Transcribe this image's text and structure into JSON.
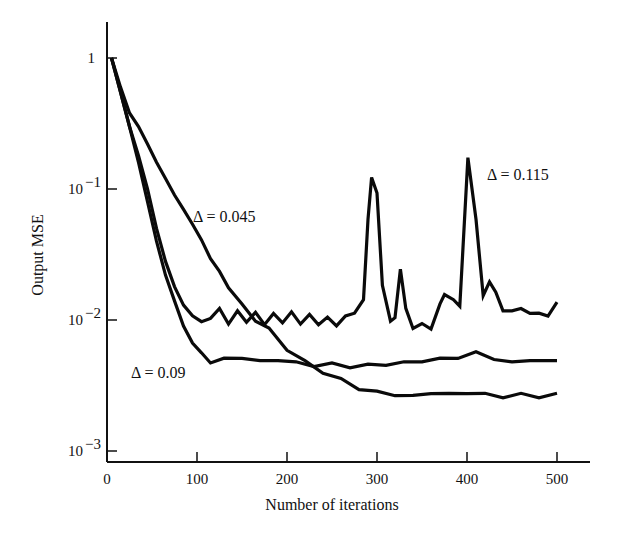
{
  "chart_data": {
    "type": "line",
    "title": "",
    "xlabel": "Number of iterations",
    "ylabel": "Output MSE",
    "xlim": [
      0,
      540
    ],
    "ylim": [
      0.001,
      1.5
    ],
    "yscale": "log",
    "grid": false,
    "legend": "none (inline annotations)",
    "x_ticks": [
      0,
      100,
      200,
      300,
      400,
      500
    ],
    "x_tick_labels": [
      "0",
      "100",
      "200",
      "300",
      "400",
      "500"
    ],
    "y_ticks": [
      1,
      0.1,
      0.01,
      0.001
    ],
    "y_tick_labels": [
      "1",
      "10^-1",
      "10^-2",
      "10^-3"
    ],
    "series": [
      {
        "name": "Δ = 0.045",
        "x": [
          5,
          15,
          25,
          35,
          45,
          55,
          65,
          75,
          85,
          95,
          105,
          115,
          125,
          135,
          150,
          165,
          180,
          200,
          220,
          240,
          260,
          280,
          300,
          320,
          340,
          360,
          380,
          400,
          420,
          440,
          460,
          480,
          500
        ],
        "y": [
          1.0,
          0.6,
          0.38,
          0.3,
          0.22,
          0.16,
          0.12,
          0.09,
          0.07,
          0.055,
          0.04,
          0.03,
          0.023,
          0.018,
          0.013,
          0.01,
          0.0085,
          0.006,
          0.0048,
          0.004,
          0.0035,
          0.003,
          0.0028,
          0.0027,
          0.0026,
          0.0028,
          0.0027,
          0.0028,
          0.0027,
          0.0026,
          0.0027,
          0.0026,
          0.0027
        ]
      },
      {
        "name": "Δ = 0.09",
        "x": [
          5,
          15,
          25,
          35,
          45,
          55,
          65,
          75,
          85,
          95,
          105,
          115,
          130,
          150,
          170,
          190,
          210,
          230,
          250,
          270,
          290,
          310,
          330,
          350,
          370,
          390,
          410,
          430,
          450,
          470,
          490,
          500
        ],
        "y": [
          1.0,
          0.55,
          0.3,
          0.16,
          0.08,
          0.04,
          0.022,
          0.014,
          0.009,
          0.0068,
          0.0055,
          0.0048,
          0.005,
          0.0052,
          0.0048,
          0.005,
          0.0047,
          0.0045,
          0.0046,
          0.0044,
          0.0045,
          0.0046,
          0.0047,
          0.0049,
          0.005,
          0.0052,
          0.0056,
          0.0051,
          0.0047,
          0.005,
          0.0048,
          0.005
        ]
      },
      {
        "name": "Δ = 0.115",
        "x": [
          5,
          15,
          25,
          35,
          45,
          55,
          65,
          75,
          85,
          95,
          105,
          115,
          125,
          135,
          145,
          155,
          165,
          175,
          185,
          195,
          205,
          215,
          225,
          235,
          245,
          255,
          265,
          275,
          285,
          290,
          294,
          300,
          306,
          315,
          320,
          326,
          332,
          340,
          350,
          360,
          370,
          375,
          385,
          392,
          401,
          410,
          418,
          425,
          432,
          440,
          450,
          460,
          470,
          480,
          490,
          500
        ],
        "y": [
          1.0,
          0.55,
          0.3,
          0.18,
          0.1,
          0.05,
          0.028,
          0.018,
          0.013,
          0.011,
          0.0095,
          0.0105,
          0.012,
          0.0095,
          0.0115,
          0.0098,
          0.0112,
          0.0094,
          0.011,
          0.0097,
          0.0113,
          0.0095,
          0.0108,
          0.0094,
          0.0103,
          0.0092,
          0.0105,
          0.0115,
          0.014,
          0.06,
          0.12,
          0.095,
          0.018,
          0.01,
          0.0102,
          0.025,
          0.012,
          0.0088,
          0.0092,
          0.0087,
          0.013,
          0.016,
          0.014,
          0.013,
          0.17,
          0.06,
          0.015,
          0.02,
          0.016,
          0.012,
          0.0115,
          0.0125,
          0.011,
          0.0115,
          0.0105,
          0.014
        ]
      }
    ],
    "annotations": [
      {
        "text": "Δ = 0.045",
        "near_x": 95,
        "near_y": 0.06
      },
      {
        "text": "Δ = 0.09",
        "near_x": 25,
        "near_y": 0.0042
      },
      {
        "text": "Δ = 0.115",
        "near_x": 425,
        "near_y": 0.13
      }
    ]
  },
  "labels": {
    "xlabel": "Number of iterations",
    "ylabel": "Output MSE",
    "annot_045": "Δ = 0.045",
    "annot_09": "Δ = 0.09",
    "annot_115": "Δ = 0.115"
  }
}
